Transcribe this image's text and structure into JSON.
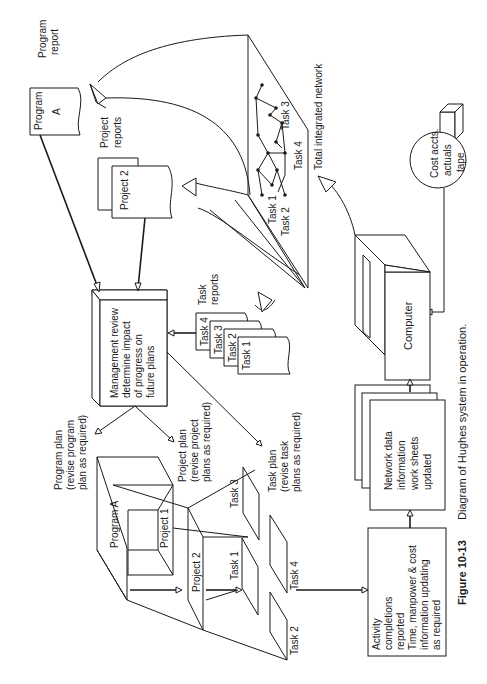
{
  "figure": {
    "number": "Figure 10-13",
    "caption": "Diagram of Hughes system in operation.",
    "orientation": "rotated 90° counter-clockwise (landscape on portrait page)"
  },
  "nodes": {
    "program_report": {
      "doc_label_1": "Program",
      "doc_label_2": "A",
      "caption_1": "Program",
      "caption_2": "report"
    },
    "project_reports": {
      "doc_label": "Project 2",
      "caption_1": "Project",
      "caption_2": "reports"
    },
    "task_reports": {
      "caption_1": "Task",
      "caption_2": "reports",
      "docs": [
        "Task 4",
        "Task 3",
        "Task 2",
        "Task 1"
      ]
    },
    "management_review": {
      "lines": [
        "Management review",
        "determine impact",
        "of progress on",
        "future plans"
      ]
    },
    "program_plan": {
      "lines": [
        "Program plan",
        "(revise program",
        "plan as required)"
      ]
    },
    "project_plan": {
      "lines": [
        "Project plan",
        "(revise project",
        "plans as required)"
      ]
    },
    "task_plan": {
      "lines": [
        "Task plan",
        "(revise task",
        "plans as required)"
      ]
    },
    "plan_stack": {
      "program": "Program A",
      "project_1": "Project 1",
      "project_2": "Project 2",
      "tasks": [
        "Task 1",
        "Task 2",
        "Task 3",
        "Task 4"
      ]
    },
    "activity": {
      "lines": [
        "Activity",
        "completions",
        "reported",
        "Time, manpower & cost",
        "information updating",
        "as required"
      ]
    },
    "network_data": {
      "lines": [
        "Network data",
        "information",
        "work sheets",
        "updated"
      ]
    },
    "computer": {
      "label": "Computer"
    },
    "cost_tape": {
      "lines": [
        "Cost accts.",
        "actuals",
        "tape"
      ]
    },
    "integrated_network": {
      "caption": "Total integrated network",
      "task_labels": [
        "Task 1",
        "Task 2",
        "Task 3",
        "Task 4"
      ]
    }
  }
}
